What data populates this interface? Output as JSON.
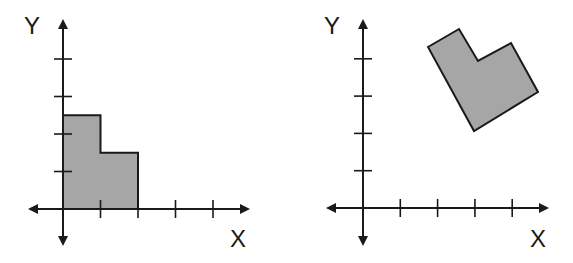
{
  "colors": {
    "stroke": "#1a1a1a",
    "fill": "#a6a6a6",
    "background": "#ffffff"
  },
  "diagrams": [
    {
      "id": "left",
      "description": "L-shaped polygon in first quadrant, before transformation",
      "x_label": "X",
      "y_label": "Y",
      "origin_px": [
        63,
        209
      ],
      "unit_px": 37.5,
      "x_ticks": [
        1,
        2,
        3,
        4
      ],
      "y_ticks": [
        1,
        2,
        3,
        4
      ],
      "axis_extent_px": {
        "left": 28,
        "right": 250,
        "top": 19,
        "bottom": 246
      },
      "label_pos_px": {
        "y": [
          24,
          14
        ],
        "x": [
          230,
          227
        ]
      },
      "shape_units": [
        [
          0,
          0
        ],
        [
          0,
          2.5
        ],
        [
          1,
          2.5
        ],
        [
          1,
          1.5
        ],
        [
          2,
          1.5
        ],
        [
          2,
          0
        ]
      ]
    },
    {
      "id": "right",
      "description": "Same L-shaped polygon, rotated and translated",
      "x_label": "X",
      "y_label": "Y",
      "origin_px": [
        363,
        208
      ],
      "unit_px": 37.3,
      "x_ticks": [
        1,
        2,
        3,
        4
      ],
      "y_ticks": [
        1,
        2,
        3,
        4
      ],
      "axis_extent_px": {
        "left": 326,
        "right": 549,
        "top": 19,
        "bottom": 246
      },
      "label_pos_px": {
        "y": [
          324,
          14
        ],
        "x": [
          530,
          227
        ]
      },
      "shape_px": [
        [
          428,
          47
        ],
        [
          459,
          29
        ],
        [
          478,
          61
        ],
        [
          511,
          43
        ],
        [
          538,
          92
        ],
        [
          474,
          131
        ]
      ]
    }
  ]
}
